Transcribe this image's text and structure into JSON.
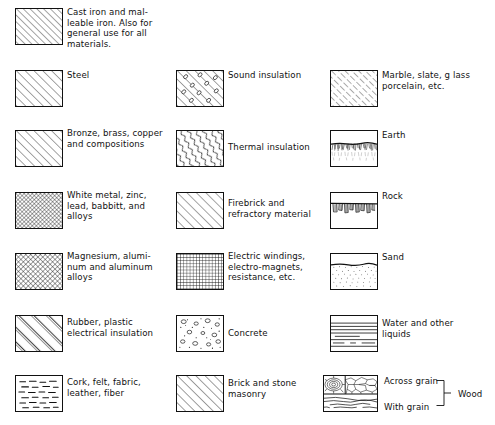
{
  "document": {
    "kind": "material-hatching-legend",
    "title": "Symbols for materials in section"
  },
  "layout": {
    "columns": [
      {
        "name": "column-left",
        "swatch_x": 15,
        "label_x": 67
      },
      {
        "name": "column-middle",
        "swatch_x": 176,
        "label_x": 222
      },
      {
        "name": "column-right",
        "swatch_x": 330,
        "label_x": 382
      }
    ],
    "rows_y": [
      8,
      70,
      130,
      192,
      253,
      315,
      375
    ],
    "swatch_width": 48,
    "swatch_height": 37
  },
  "entries": [
    {
      "id": "cast-iron",
      "pattern": "diagonal-hatch-45",
      "column": 0,
      "row": 0,
      "label": "Cast iron and mal-\nleable iron. Also for\ngeneral use for all\nmaterials."
    },
    {
      "id": "steel",
      "pattern": "diagonal-hatch-45-wide",
      "column": 0,
      "row": 1,
      "label": "Steel"
    },
    {
      "id": "bronze-brass-copper",
      "pattern": "diagonal-hatch-45-wide",
      "column": 0,
      "row": 2,
      "label": "Bronze, brass, copper\nand compositions"
    },
    {
      "id": "white-metal-zinc",
      "pattern": "fine-crosshatch",
      "column": 0,
      "row": 3,
      "label": "White metal, zinc,\nlead, babbitt, and\nalloys"
    },
    {
      "id": "magnesium-aluminum",
      "pattern": "fine-crosshatch",
      "column": 0,
      "row": 4,
      "label": "Magnesium, alumi-\nnum and aluminum\nalloys"
    },
    {
      "id": "rubber-plastic",
      "pattern": "diagonal-hatch-wide-sparse",
      "column": 0,
      "row": 5,
      "label": "Rubber, plastic\nelectrical insulation"
    },
    {
      "id": "cork-felt-fabric",
      "pattern": "dashes",
      "column": 0,
      "row": 6,
      "label": "Cork, felt, fabric,\nleather, fiber"
    },
    {
      "id": "sound-insulation",
      "pattern": "hatch-with-circles",
      "column": 1,
      "row": 1,
      "label": "Sound insulation"
    },
    {
      "id": "thermal-insulation",
      "pattern": "wavy-diagonal",
      "column": 1,
      "row": 2,
      "label": "Thermal insulation"
    },
    {
      "id": "firebrick-refractory",
      "pattern": "diagonal-hatch-45-wide",
      "column": 1,
      "row": 3,
      "label": "Firebrick and\nrefractory material"
    },
    {
      "id": "electric-windings",
      "pattern": "grid",
      "column": 1,
      "row": 4,
      "label": "Electric windings,\nelectro-magnets,\nresistance, etc."
    },
    {
      "id": "concrete",
      "pattern": "aggregate-dots",
      "column": 1,
      "row": 5,
      "label": "Concrete"
    },
    {
      "id": "brick-stone-masonry",
      "pattern": "diagonal-hatch-45-wide",
      "column": 1,
      "row": 6,
      "label": "Brick and stone\nmasonry"
    },
    {
      "id": "marble-slate-glass",
      "pattern": "diagonal-hatch-fine-broken",
      "column": 2,
      "row": 1,
      "label": "Marble, slate, g lass\nporcelain, etc."
    },
    {
      "id": "earth",
      "pattern": "earth",
      "column": 2,
      "row": 2,
      "label": "Earth"
    },
    {
      "id": "rock",
      "pattern": "rock",
      "column": 2,
      "row": 3,
      "label": "Rock"
    },
    {
      "id": "sand",
      "pattern": "sand",
      "column": 2,
      "row": 4,
      "label": "Sand"
    },
    {
      "id": "water-and-other-liquids",
      "pattern": "horizontal-lines",
      "column": 2,
      "row": 5,
      "label": "Water and other\nliquids"
    },
    {
      "id": "wood",
      "pattern": "wood",
      "column": 2,
      "row": 6,
      "label": ""
    }
  ],
  "wood_group": {
    "across_grain_label": "Across grain",
    "with_grain_label": "With grain",
    "group_label": "Wood"
  }
}
